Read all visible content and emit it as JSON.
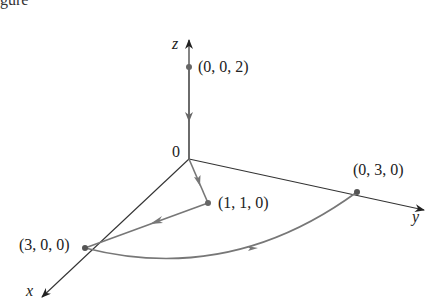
{
  "caption_fragment": "gure",
  "axes": {
    "z_label": "z",
    "y_label": "y",
    "x_label": "x",
    "origin_label": "0"
  },
  "points": [
    {
      "label": "(0, 0, 2)"
    },
    {
      "label": "(1, 1, 0)"
    },
    {
      "label": "(3, 0, 0)"
    },
    {
      "label": "(0, 3, 0)"
    }
  ],
  "colors": {
    "axis": "#333333",
    "path": "#777777",
    "point": "#666666"
  }
}
